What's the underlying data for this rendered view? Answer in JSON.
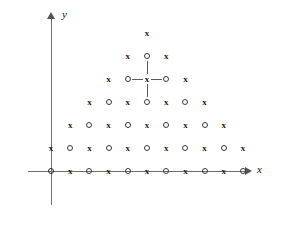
{
  "figure": {
    "title": "",
    "axes": {
      "x_label": "x",
      "y_label": "y",
      "x_arrow_icon": "arrow-right-icon",
      "y_arrow_icon": "arrow-up-icon",
      "axis_color": "#6e6e6e"
    },
    "markers": {
      "cross_glyph": "x",
      "circle_glyph": "O",
      "marker_color": "#1a1a1a"
    },
    "highlight": {
      "center": {
        "col": 5,
        "row": 4,
        "glyph": "O"
      },
      "neighbors": [
        "left",
        "right",
        "up",
        "down"
      ],
      "line_color": "#5a5a5a"
    }
  },
  "chart_data": {
    "type": "scatter",
    "title": "",
    "xlabel": "x",
    "ylabel": "y",
    "grid": false,
    "legend": null,
    "spacing_px": {
      "x": 19.2,
      "y": 23
    },
    "origin_px": {
      "x": 51,
      "y": 171
    },
    "rows": [
      {
        "row": 0,
        "y_px": 171,
        "start_col": 0,
        "glyphs": [
          "O",
          "x",
          "O",
          "x",
          "O",
          "x",
          "O",
          "x",
          "O",
          "x",
          "O"
        ]
      },
      {
        "row": 1,
        "y_px": 148,
        "start_col": 0,
        "glyphs": [
          "x",
          "O",
          "x",
          "O",
          "x",
          "O",
          "x",
          "O",
          "x",
          "O",
          "x"
        ]
      },
      {
        "row": 2,
        "y_px": 125,
        "start_col": 1,
        "glyphs": [
          "x",
          "O",
          "x",
          "O",
          "x",
          "O",
          "x",
          "O",
          "x"
        ]
      },
      {
        "row": 3,
        "y_px": 102,
        "start_col": 2,
        "glyphs": [
          "x",
          "O",
          "x",
          "O",
          "x",
          "O",
          "x"
        ]
      },
      {
        "row": 4,
        "y_px": 79,
        "start_col": 3,
        "glyphs": [
          "x",
          "O",
          "x",
          "O",
          "x"
        ]
      },
      {
        "row": 5,
        "y_px": 56,
        "start_col": 4,
        "glyphs": [
          "x",
          "O",
          "x"
        ]
      },
      {
        "row": 6,
        "y_px": 33,
        "start_col": 5,
        "glyphs": [
          "x"
        ]
      }
    ]
  }
}
